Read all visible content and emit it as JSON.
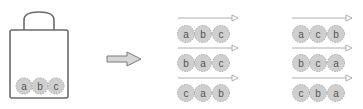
{
  "bag": {
    "balls": [
      "a",
      "b",
      "c"
    ]
  },
  "colors": {
    "stroke": "#6b6b6b",
    "ball_fill": "#cfcfcf",
    "ball_stroke": "#a8a8a8",
    "arrow_fill": "#d6d6d6",
    "line": "#9a9a9a"
  },
  "permutations": {
    "left": [
      [
        "a",
        "b",
        "c"
      ],
      [
        "b",
        "a",
        "c"
      ],
      [
        "c",
        "a",
        "b"
      ]
    ],
    "right": [
      [
        "a",
        "c",
        "b"
      ],
      [
        "b",
        "c",
        "a"
      ],
      [
        "c",
        "b",
        "a"
      ]
    ]
  }
}
